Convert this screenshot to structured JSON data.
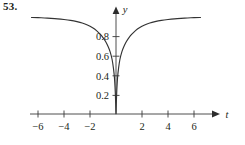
{
  "figure": {
    "exercise_number": "53."
  },
  "chart_data": {
    "type": "line",
    "title": "",
    "subtitle": "",
    "xlabel": "t",
    "ylabel": "y",
    "grid": false,
    "legend": null,
    "xlim": [
      -7,
      7
    ],
    "ylim": [
      0,
      1.08
    ],
    "x_ticks": [
      -6,
      -4,
      -2,
      2,
      4,
      6
    ],
    "x_tick_labels": [
      "−6",
      "−4",
      "−2",
      "2",
      "4",
      "6"
    ],
    "y_ticks": [
      0.2,
      0.4,
      0.6,
      0.8
    ],
    "y_tick_labels": [
      "0.2",
      "0.4",
      "0.6",
      "0.8"
    ],
    "x_axis_arrow": true,
    "y_axis_arrow": true,
    "series": [
      {
        "name": "curve",
        "color": "#333333",
        "x": [
          -6.5,
          -6.0,
          -5.5,
          -5.0,
          -4.5,
          -4.0,
          -3.5,
          -3.0,
          -2.6,
          -2.2,
          -1.8,
          -1.5,
          -1.2,
          -1.0,
          -0.8,
          -0.6,
          -0.45,
          -0.3,
          -0.2,
          -0.12,
          -0.06,
          -0.02,
          0.0,
          0.02,
          0.06,
          0.12,
          0.2,
          0.3,
          0.45,
          0.6,
          0.8,
          1.0,
          1.2,
          1.5,
          1.8,
          2.2,
          2.6,
          3.0,
          3.5,
          4.0,
          4.5,
          5.0,
          5.5,
          6.0,
          6.5
        ],
        "y": [
          0.985,
          0.983,
          0.98,
          0.976,
          0.971,
          0.964,
          0.955,
          0.942,
          0.928,
          0.908,
          0.88,
          0.851,
          0.812,
          0.78,
          0.74,
          0.686,
          0.634,
          0.556,
          0.47,
          0.37,
          0.235,
          0.095,
          0.0,
          0.095,
          0.235,
          0.37,
          0.47,
          0.556,
          0.634,
          0.686,
          0.74,
          0.78,
          0.812,
          0.851,
          0.88,
          0.908,
          0.928,
          0.942,
          0.955,
          0.964,
          0.971,
          0.976,
          0.98,
          0.983,
          0.985
        ]
      }
    ]
  }
}
